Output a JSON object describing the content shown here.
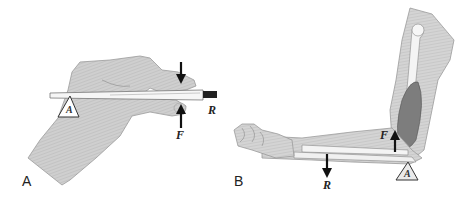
{
  "figure": {
    "panels": [
      {
        "id": "A",
        "label": "A",
        "subject": "hand holding pen (tweezers)",
        "labels": {
          "fulcrum": "A",
          "force": "F",
          "resistance": "R"
        }
      },
      {
        "id": "B",
        "label": "B",
        "subject": "forearm flexed at elbow with biceps",
        "labels": {
          "fulcrum": "A",
          "force": "F",
          "resistance": "R"
        }
      }
    ],
    "colors": {
      "skin": "#c8c8c8",
      "skin_outline": "#8a8a8a",
      "bone": "#f4f4f4",
      "muscle": "#7a7a7a",
      "arrow": "#111111",
      "background": "#ffffff"
    }
  }
}
